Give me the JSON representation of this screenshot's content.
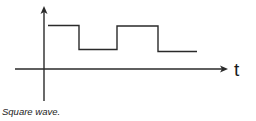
{
  "diagram": {
    "title": "Square wave",
    "caption": "Square wave.",
    "axis_label_x": "t",
    "axis_label_y": "",
    "colors": {
      "line": "#2a2a2a",
      "background": "#ffffff"
    },
    "waveform": {
      "type": "square",
      "levels": [
        "high",
        "low",
        "high",
        "low"
      ],
      "segments": [
        {
          "level": "high",
          "x_start": 48,
          "x_end": 79
        },
        {
          "level": "low",
          "x_start": 79,
          "x_end": 117
        },
        {
          "level": "high",
          "x_start": 117,
          "x_end": 158
        },
        {
          "level": "low",
          "x_start": 158,
          "x_end": 197
        }
      ]
    }
  }
}
